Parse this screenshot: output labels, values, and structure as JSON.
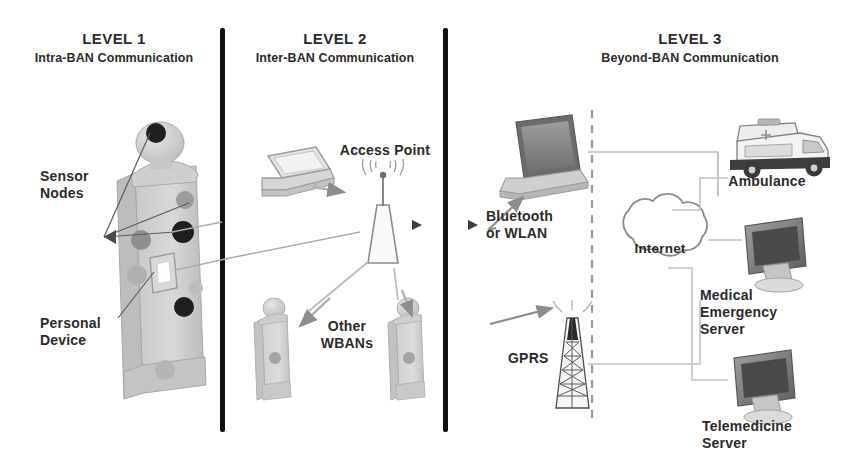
{
  "figure": {
    "levels": [
      {
        "id": "level-1",
        "name": "LEVEL 1",
        "subtitle": "Intra-BAN Communication"
      },
      {
        "id": "level-2",
        "name": "LEVEL 2",
        "subtitle": "Inter-BAN Communication"
      },
      {
        "id": "level-3",
        "name": "LEVEL 3",
        "subtitle": "Beyond-BAN Communication"
      }
    ],
    "labels": {
      "sensor_nodes": "Sensor\nNodes",
      "sensor_nodes_l1": "Sensor",
      "sensor_nodes_l2": "Nodes",
      "personal_device_l1": "Personal",
      "personal_device_l2": "Device",
      "access_point": "Access Point",
      "other_wbans_l1": "Other",
      "other_wbans_l2": "WBANs",
      "bluetooth_l1": "Bluetooth",
      "bluetooth_l2": "or WLAN",
      "gprs": "GPRS",
      "internet": "Internet",
      "ambulance": "Ambulance",
      "medical_l1": "Medical",
      "medical_l2": "Emergency",
      "medical_l3": "Server",
      "telemedicine_l1": "Telemedicine",
      "telemedicine_l2": "Server"
    },
    "colors": {
      "text": "#2b2b2b",
      "divider": "#111111",
      "body_fill": "#d2d2d2",
      "body_shade": "#b9b9b9",
      "sensor_dark": "#2a2a2a",
      "sensor_gray": "#9a9a9a",
      "line": "#9a9a9a",
      "cloud": "#7d7d7d",
      "dashed": "#9a9a9a"
    },
    "icons": {
      "person": "human-body-icon",
      "laptop": "laptop-icon",
      "tower": "antenna-tower-icon",
      "cloud": "internet-cloud-icon",
      "ambulance": "ambulance-icon",
      "monitor": "server-monitor-icon"
    }
  }
}
